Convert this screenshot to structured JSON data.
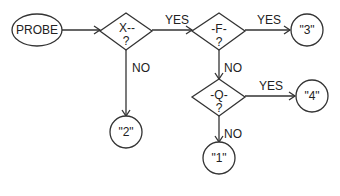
{
  "diagram": {
    "type": "flowchart",
    "nodes": {
      "probe": {
        "shape": "ellipse",
        "text": "PROBE"
      },
      "x": {
        "shape": "diamond",
        "text": "X--",
        "sub": "?"
      },
      "f": {
        "shape": "diamond",
        "text": "-F-",
        "sub": "?"
      },
      "q": {
        "shape": "diamond",
        "text": "-Q-",
        "sub": "?"
      },
      "out3": {
        "shape": "circle",
        "text": "\"3\""
      },
      "out4": {
        "shape": "circle",
        "text": "\"4\""
      },
      "out2": {
        "shape": "circle",
        "text": "\"2\""
      },
      "out1": {
        "shape": "circle",
        "text": "\"1\""
      }
    },
    "edges": [
      {
        "from": "probe",
        "to": "x",
        "label": ""
      },
      {
        "from": "x",
        "to": "f",
        "label": "YES"
      },
      {
        "from": "x",
        "to": "out2",
        "label": "NO"
      },
      {
        "from": "f",
        "to": "out3",
        "label": "YES"
      },
      {
        "from": "f",
        "to": "q",
        "label": "NO"
      },
      {
        "from": "q",
        "to": "out4",
        "label": "YES"
      },
      {
        "from": "q",
        "to": "out1",
        "label": "NO"
      }
    ]
  }
}
